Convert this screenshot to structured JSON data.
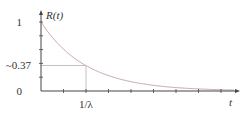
{
  "chart_data": {
    "type": "line",
    "title": "",
    "xlabel": "t",
    "ylabel": "R(t)",
    "function": "R(t) = exp(-lambda * t)",
    "series": [
      {
        "name": "R(t)",
        "x_in_units_of_1_over_lambda": [
          0,
          0.5,
          1,
          1.5,
          2,
          2.5,
          3,
          3.5,
          4,
          4.5,
          5,
          5.5,
          6
        ],
        "values": [
          1,
          0.607,
          0.368,
          0.223,
          0.135,
          0.082,
          0.05,
          0.03,
          0.018,
          0.011,
          0.007,
          0.004,
          0.002
        ]
      }
    ],
    "xlim": [
      0,
      6
    ],
    "ylim": [
      0,
      1
    ],
    "ytick_labels": [
      "1",
      "~0.37",
      "0"
    ],
    "ytick_values": [
      1,
      0.37,
      0
    ],
    "xtick_labels": [
      "1/λ"
    ],
    "xtick_values": [
      1
    ],
    "minor_y_ticks": [
      0.2,
      0.4,
      0.6,
      0.8
    ],
    "minor_x_ticks": [
      0.5,
      1,
      1.5,
      2,
      2.5,
      3,
      3.5,
      4,
      4.5,
      5,
      5.5
    ],
    "annotations": [
      {
        "type": "guide-lines",
        "x": 1,
        "y": 0.37
      }
    ],
    "grid": false,
    "legend": "none",
    "colors": {
      "curve": "#c9a9ad",
      "axes": "#444444",
      "guides": "#b0b0b0"
    }
  }
}
